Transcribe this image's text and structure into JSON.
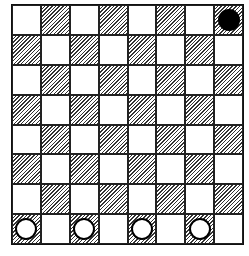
{
  "board": {
    "rows": 8,
    "cols": 8,
    "top_left_color": "light",
    "colors": {
      "light": "#ffffff",
      "dark_hatch": "#333333",
      "line": "#111111"
    }
  },
  "pieces": [
    {
      "color": "black",
      "row": 0,
      "col": 7
    },
    {
      "color": "white",
      "row": 7,
      "col": 0
    },
    {
      "color": "white",
      "row": 7,
      "col": 2
    },
    {
      "color": "white",
      "row": 7,
      "col": 4
    },
    {
      "color": "white",
      "row": 7,
      "col": 6
    }
  ]
}
